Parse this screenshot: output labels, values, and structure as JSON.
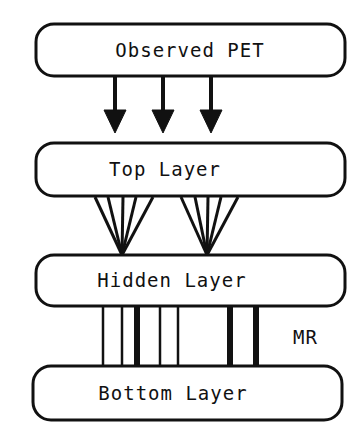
{
  "diagram": {
    "layers": [
      {
        "id": "observed",
        "label": "Observed PET"
      },
      {
        "id": "top",
        "label": "Top Layer"
      },
      {
        "id": "hidden",
        "label": "Hidden Layer"
      },
      {
        "id": "bottom",
        "label": "Bottom Layer"
      }
    ],
    "side_label": "MR",
    "connections": {
      "observed_to_top": "3 arrows",
      "top_to_hidden": "2 fans of 5 lines",
      "hidden_to_bottom": "7 vertical bars (3 thick)"
    }
  }
}
